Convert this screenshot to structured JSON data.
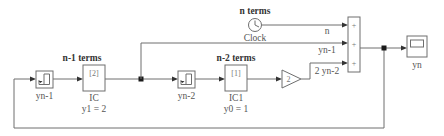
{
  "diagram": {
    "group_labels": {
      "n_minus_1_terms": "n-1 terms",
      "n_minus_2_terms": "n-2 terms",
      "n_terms": "n terms"
    },
    "blocks": {
      "delay1": {
        "label": "yn-1",
        "icon": "unit-delay-icon"
      },
      "ic": {
        "value": "[2]",
        "label": "IC",
        "sublabel": "y1 = 2"
      },
      "delay2": {
        "label": "yn-2",
        "icon": "unit-delay-icon"
      },
      "ic1": {
        "value": "[1]",
        "label": "IC1",
        "sublabel": "y0 = 1"
      },
      "gain": {
        "value": "2"
      },
      "clock": {
        "label": "Clock",
        "icon": "clock-icon"
      },
      "sum": {
        "signs": [
          "+",
          "+",
          "+"
        ]
      },
      "scope": {
        "label": "yn",
        "icon": "scope-icon"
      }
    },
    "signal_labels": {
      "n": "n",
      "yn_1": "yn-1",
      "two_yn_2": "2 yn-2"
    },
    "colors": {
      "wire": "#6e6e6e",
      "arrow": "#333333",
      "background": "#ffffff"
    }
  }
}
